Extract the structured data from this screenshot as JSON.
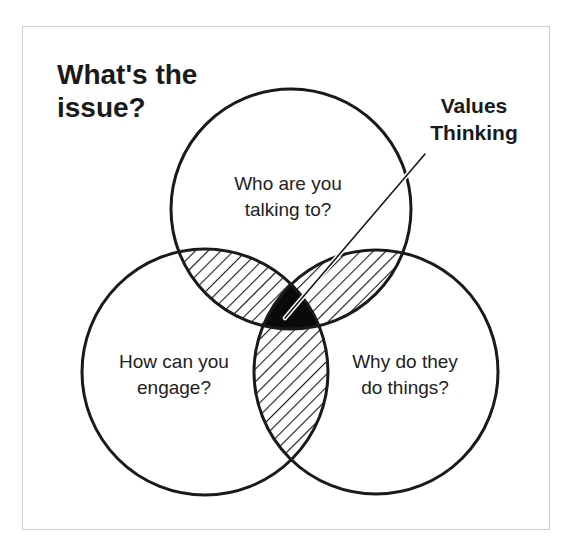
{
  "figure": {
    "title_lines": [
      "What's the",
      "issue?"
    ],
    "callout": {
      "label_lines": [
        "Values",
        "Thinking"
      ],
      "points_to": "center-intersection"
    },
    "circles": [
      {
        "id": "top",
        "label_lines": [
          "Who are you",
          "talking to?"
        ]
      },
      {
        "id": "left",
        "label_lines": [
          "How can you",
          "engage?"
        ]
      },
      {
        "id": "right",
        "label_lines": [
          "Why do they",
          "do things?"
        ]
      }
    ],
    "styles": {
      "stroke_color": "#1a1a1a",
      "center_fill": "#0a0a0a",
      "hatch_color": "#1a1a1a",
      "frame_border": "#cfcfcf",
      "background": "#ffffff"
    }
  }
}
